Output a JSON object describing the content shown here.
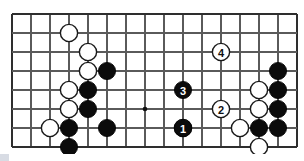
{
  "figure": {
    "board": {
      "background_color": "#ffffff",
      "line_color": "#5a5a5a",
      "edge_color": "#2e2e2e",
      "black_stone_color": "#0b0b0b",
      "white_stone_color": "#ffffff",
      "columns": 16,
      "rows": 8,
      "origin_x": 12,
      "origin_y": 14,
      "spacing": 19,
      "stone_radius": 8.6,
      "edges_visible": [
        "left",
        "top",
        "right",
        "bottom"
      ]
    },
    "hoshi_points": [
      {
        "col": 7,
        "row": 5
      }
    ],
    "stones": [
      {
        "col": 3,
        "row": 1,
        "color": "white",
        "label": ""
      },
      {
        "col": 4,
        "row": 2,
        "color": "white",
        "label": ""
      },
      {
        "col": 4,
        "row": 3,
        "color": "white",
        "label": ""
      },
      {
        "col": 5,
        "row": 3,
        "color": "black",
        "label": ""
      },
      {
        "col": 3,
        "row": 4,
        "color": "white",
        "label": ""
      },
      {
        "col": 4,
        "row": 4,
        "color": "black",
        "label": ""
      },
      {
        "col": 3,
        "row": 5,
        "color": "white",
        "label": ""
      },
      {
        "col": 4,
        "row": 5,
        "color": "black",
        "label": ""
      },
      {
        "col": 2,
        "row": 6,
        "color": "white",
        "label": ""
      },
      {
        "col": 3,
        "row": 6,
        "color": "black",
        "label": ""
      },
      {
        "col": 5,
        "row": 6,
        "color": "black",
        "label": ""
      },
      {
        "col": 3,
        "row": 7,
        "color": "black",
        "label": ""
      },
      {
        "col": 9,
        "row": 6,
        "color": "white",
        "label": ""
      },
      {
        "col": 9,
        "row": 4,
        "color": "black",
        "label": "3"
      },
      {
        "col": 9,
        "row": 6,
        "color": "black",
        "label": "1"
      },
      {
        "col": 11,
        "row": 5,
        "color": "white",
        "label": "2"
      },
      {
        "col": 11,
        "row": 2,
        "color": "white",
        "label": "4"
      },
      {
        "col": 12,
        "row": 6,
        "color": "white",
        "label": ""
      },
      {
        "col": 13,
        "row": 4,
        "color": "white",
        "label": ""
      },
      {
        "col": 13,
        "row": 5,
        "color": "white",
        "label": ""
      },
      {
        "col": 13,
        "row": 6,
        "color": "black",
        "label": ""
      },
      {
        "col": 13,
        "row": 7,
        "color": "white",
        "label": ""
      },
      {
        "col": 14,
        "row": 3,
        "color": "black",
        "label": ""
      },
      {
        "col": 14,
        "row": 4,
        "color": "black",
        "label": ""
      },
      {
        "col": 14,
        "row": 5,
        "color": "black",
        "label": ""
      },
      {
        "col": 14,
        "row": 6,
        "color": "black",
        "label": ""
      }
    ],
    "move_sequence": [
      {
        "number": "1",
        "color": "black"
      },
      {
        "number": "2",
        "color": "white"
      },
      {
        "number": "3",
        "color": "black"
      },
      {
        "number": "4",
        "color": "white"
      }
    ]
  }
}
